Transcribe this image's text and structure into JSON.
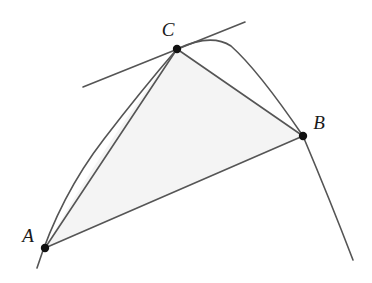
{
  "figure": {
    "background_color": "#ffffff",
    "width": 372,
    "height": 283
  },
  "style": {
    "stroke_color": "#555555",
    "stroke_width": 1.6,
    "point_color": "#111111",
    "point_radius": 4.2,
    "fill_color": "#f4f4f4",
    "fill_stroke": "#d8d8d8",
    "label_color": "#1a1a1a"
  },
  "points": [
    {
      "id": "A",
      "label": "A",
      "x": 45,
      "y": 248,
      "label_x": 28,
      "label_y": 235
    },
    {
      "id": "B",
      "label": "B",
      "x": 303,
      "y": 136,
      "label_x": 319,
      "label_y": 122
    },
    {
      "id": "C",
      "label": "C",
      "x": 177,
      "y": 49,
      "label_x": 168,
      "label_y": 29
    }
  ],
  "curves": {
    "parabola": {
      "name": "parabola",
      "apex": {
        "x": 225,
        "y": 43
      },
      "left_tail_end": {
        "x": 37,
        "y": 268
      },
      "right_tail_end": {
        "x": 353,
        "y": 260
      },
      "path": "M 37 268 Q 60 196 104 139 Q 140 92 177 49 Q 211 33 231 46 Q 258 70 303 136 Q 330 200 353 260"
    },
    "arc_A_to_C": {
      "name": "parabola-arc-A-C",
      "path": "M 45 248 Q 100 150 177 49"
    },
    "arc_C_to_B": {
      "name": "parabola-arc-C-B",
      "path": "M 177 49 Q 228 36 303 136"
    }
  },
  "segments": [
    {
      "name": "chord-AC",
      "from": "A",
      "to": "C",
      "x1": 45,
      "y1": 248,
      "x2": 177,
      "y2": 49
    },
    {
      "name": "chord-CB",
      "from": "C",
      "to": "B",
      "x1": 177,
      "y1": 49,
      "x2": 303,
      "y2": 136
    },
    {
      "name": "chord-AB",
      "from": "A",
      "to": "B",
      "x1": 45,
      "y1": 248,
      "x2": 303,
      "y2": 136
    }
  ],
  "tangent_line": {
    "name": "tangent-at-C",
    "touch_point": "C",
    "x1": 83,
    "y1": 87,
    "x2": 245,
    "y2": 22
  },
  "shaded_region": {
    "name": "parabolic-segment-shading",
    "description": "Region bounded by parabolic arc from A to C, chord C to B, and chord B to A",
    "path": "M 45 248 Q 100 150 177 49 L 303 136 Z"
  }
}
